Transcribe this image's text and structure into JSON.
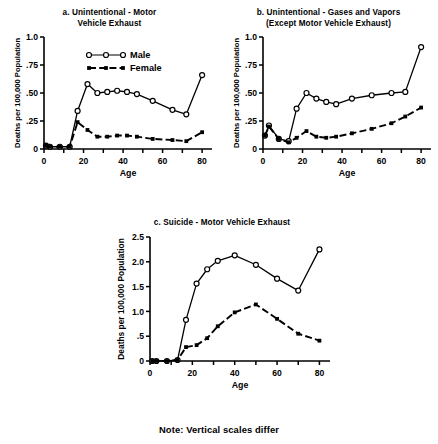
{
  "figure": {
    "note": "Note: Vertical scales differ",
    "ylabel": "Deaths per 100,000 Population",
    "xlabel": "Age",
    "legend": {
      "male_label": "Male",
      "female_label": "Female"
    },
    "colors": {
      "ink": "#000000",
      "background": "#ffffff"
    }
  },
  "chart_data": [
    {
      "id": "a",
      "type": "line",
      "title": "a. Unintentional - Motor\nVehicle Exhaust",
      "xlabel": "Age",
      "ylabel": "Deaths per 100,000 Population",
      "xlim": [
        0,
        85
      ],
      "ylim": [
        0,
        1.0
      ],
      "xticks": [
        0,
        20,
        40,
        60,
        80
      ],
      "yticks": [
        0,
        0.25,
        0.5,
        0.75,
        1.0
      ],
      "ytick_labels": [
        "0",
        ".25",
        ".50",
        ".75",
        "1.0"
      ],
      "grid": false,
      "legend_position": "upper-center",
      "x": [
        1,
        3,
        8,
        13,
        17,
        22,
        27,
        32,
        37,
        42,
        47,
        55,
        65,
        72,
        80
      ],
      "series": [
        {
          "name": "Male",
          "marker": "open-circle",
          "line": "solid",
          "values": [
            0.03,
            0.02,
            0.02,
            0.02,
            0.34,
            0.58,
            0.5,
            0.51,
            0.52,
            0.51,
            0.49,
            0.43,
            0.35,
            0.31,
            0.66
          ]
        },
        {
          "name": "Female",
          "marker": "filled-square",
          "line": "dashed",
          "values": [
            0.03,
            0.02,
            0.02,
            0.02,
            0.24,
            0.17,
            0.11,
            0.11,
            0.12,
            0.12,
            0.11,
            0.09,
            0.08,
            0.07,
            0.15
          ]
        }
      ]
    },
    {
      "id": "b",
      "type": "line",
      "title": "b. Unintentional - Gases and Vapors\n(Except Motor Vehicle Exhaust)",
      "xlabel": "Age",
      "ylabel": "Deaths per 100,000 Population",
      "xlim": [
        0,
        85
      ],
      "ylim": [
        0,
        1.0
      ],
      "xticks": [
        0,
        20,
        40,
        60,
        80
      ],
      "yticks": [
        0,
        0.25,
        0.5,
        0.75,
        1.0
      ],
      "ytick_labels": [
        "0",
        ".25",
        ".50",
        ".75",
        "1.0"
      ],
      "grid": false,
      "legend_position": "none",
      "x": [
        1,
        3,
        8,
        13,
        17,
        22,
        27,
        32,
        37,
        45,
        55,
        65,
        72,
        80
      ],
      "series": [
        {
          "name": "Male",
          "marker": "open-circle",
          "line": "solid",
          "values": [
            0.12,
            0.21,
            0.09,
            0.07,
            0.36,
            0.5,
            0.45,
            0.42,
            0.4,
            0.45,
            0.48,
            0.5,
            0.51,
            0.91
          ]
        },
        {
          "name": "Female",
          "marker": "filled-square",
          "line": "dashed",
          "values": [
            0.12,
            0.2,
            0.09,
            0.06,
            0.1,
            0.16,
            0.11,
            0.1,
            0.11,
            0.14,
            0.18,
            0.23,
            0.29,
            0.37
          ]
        }
      ]
    },
    {
      "id": "c",
      "type": "line",
      "title": "c. Suicide - Motor Vehicle Exhaust",
      "xlabel": "Age",
      "ylabel": "Deaths per 100,000 Population",
      "xlim": [
        0,
        85
      ],
      "ylim": [
        0,
        2.5
      ],
      "xticks": [
        0,
        20,
        40,
        60,
        80
      ],
      "yticks": [
        0,
        0.5,
        1.0,
        1.5,
        2.0,
        2.5
      ],
      "ytick_labels": [
        "0",
        ".5",
        "1.0",
        "1.5",
        "2.0",
        "2.5"
      ],
      "grid": false,
      "legend_position": "none",
      "x": [
        1,
        3,
        8,
        13,
        17,
        22,
        27,
        32,
        40,
        50,
        60,
        70,
        80
      ],
      "series": [
        {
          "name": "Male",
          "marker": "open-circle",
          "line": "solid",
          "values": [
            0.0,
            0.0,
            0.0,
            0.02,
            0.83,
            1.56,
            1.85,
            2.02,
            2.13,
            1.94,
            1.66,
            1.42,
            2.25
          ]
        },
        {
          "name": "Female",
          "marker": "filled-square",
          "line": "dashed",
          "values": [
            0.0,
            0.0,
            0.0,
            0.02,
            0.28,
            0.32,
            0.46,
            0.7,
            0.98,
            1.14,
            0.85,
            0.55,
            0.41
          ]
        }
      ]
    }
  ]
}
